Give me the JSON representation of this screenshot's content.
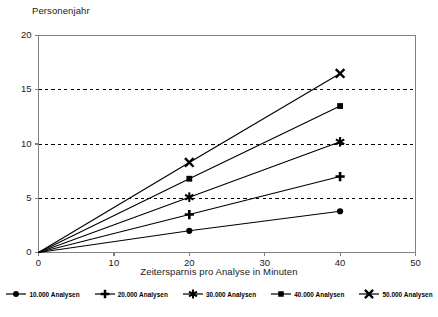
{
  "chart_data": {
    "type": "line",
    "title": "",
    "ylabel": "Personenjahr",
    "xlabel": "Zeitersparnis pro Analyse in Minuten",
    "xlim": [
      0,
      50
    ],
    "ylim": [
      0,
      20
    ],
    "xticks": [
      0,
      10,
      20,
      30,
      40,
      50
    ],
    "yticks": [
      0,
      5,
      10,
      15,
      20
    ],
    "grid": "horizontal-dashed",
    "legend_position": "bottom",
    "x": [
      0,
      20,
      40
    ],
    "series": [
      {
        "name": "10.000 Analysen",
        "marker": "circle",
        "values": [
          0,
          2.0,
          3.8
        ]
      },
      {
        "name": "20.000 Analysen",
        "marker": "plus",
        "values": [
          0,
          3.5,
          7.0
        ]
      },
      {
        "name": "30.000 Analysen",
        "marker": "star",
        "values": [
          0,
          5.1,
          10.2
        ]
      },
      {
        "name": "40.000 Analysen",
        "marker": "square",
        "values": [
          0,
          6.8,
          13.5
        ]
      },
      {
        "name": "50.000 Analysen",
        "marker": "cross",
        "values": [
          0,
          8.3,
          16.5
        ]
      }
    ],
    "colors": {
      "line": "#000000",
      "grid": "#000000",
      "axis": "#808080",
      "background": "#ffffff"
    }
  }
}
